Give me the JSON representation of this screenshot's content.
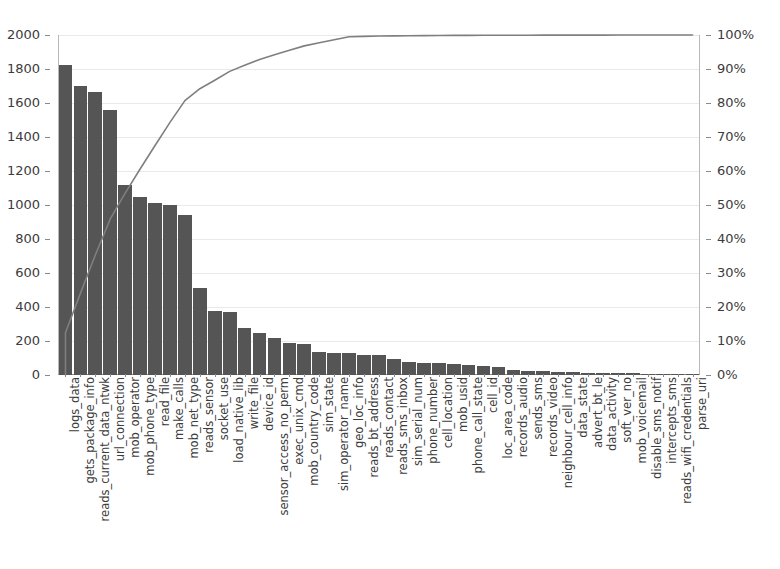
{
  "chart_data": {
    "type": "bar",
    "title": "",
    "subtitle": "",
    "xlabel": "",
    "ylabel": "",
    "y2label": "",
    "grid": true,
    "legend_position": "none",
    "ylim": [
      0,
      2000
    ],
    "y2lim": [
      0,
      100
    ],
    "y_ticks": [
      0,
      200,
      400,
      600,
      800,
      1000,
      1200,
      1400,
      1600,
      1800,
      2000
    ],
    "y_tick_labels": [
      "0",
      "200",
      "400",
      "600",
      "800",
      "1000",
      "1200",
      "1400",
      "1600",
      "1800",
      "2000"
    ],
    "y2_ticks": [
      0,
      10,
      20,
      30,
      40,
      50,
      60,
      70,
      80,
      90,
      100
    ],
    "y2_tick_labels": [
      "0%",
      "10%",
      "20%",
      "30%",
      "40%",
      "50%",
      "60%",
      "70%",
      "80%",
      "90%",
      "100%"
    ],
    "bar_color": "#555555",
    "line_color": "#7f7f7f",
    "grid_color": "#e9e9e9",
    "axis_color": "#8a8a8a",
    "categories": [
      "logs_data",
      "gets_package_info",
      "reads_current_data_ntwk",
      "url_connection",
      "mob_operator",
      "mob_phone_type",
      "read_file",
      "make_calls",
      "mob_net_type",
      "reads_sensor",
      "socket_use",
      "load_native_lib",
      "write_file",
      "device_id",
      "sensor_access_no_perm",
      "exec_unix_cmd",
      "mob_country_code",
      "sim_state",
      "sim_operator_name",
      "geo_loc_info",
      "reads_bt_address",
      "reads_contact",
      "reads_sms_inbox",
      "sim_serial_num",
      "phone_number",
      "cell_location",
      "mob_usid",
      "phone_call_state",
      "cell_id",
      "loc_area_code",
      "records_audio",
      "sends_sms",
      "records_video",
      "neighbour_cell_info",
      "data_state",
      "advert_bt_le",
      "data_activity",
      "soft_ver_no",
      "mob_voicemail",
      "disable_sms_notif",
      "intercepts_sms",
      "reads_wifi_credentials",
      "parse_uri"
    ],
    "series": [
      {
        "name": "Frequency",
        "axis": "left",
        "type": "bar",
        "values": [
          1825,
          1700,
          1665,
          1560,
          1115,
          1050,
          1010,
          1000,
          940,
          510,
          375,
          370,
          275,
          250,
          215,
          190,
          180,
          135,
          132,
          130,
          120,
          115,
          95,
          78,
          72,
          68,
          62,
          58,
          52,
          46,
          28,
          26,
          22,
          20,
          17,
          14,
          12,
          10,
          9,
          8,
          7,
          6,
          4
        ]
      },
      {
        "name": "Cumulative %",
        "axis": "right",
        "type": "line",
        "values": [
          12.4,
          24.0,
          35.3,
          45.9,
          53.5,
          60.6,
          67.5,
          74.3,
          80.7,
          84.2,
          86.7,
          89.3,
          91.1,
          92.8,
          94.2,
          95.5,
          96.8,
          97.7,
          98.6,
          99.5,
          99.6,
          99.7,
          99.75,
          99.8,
          99.83,
          99.86,
          99.88,
          99.9,
          99.91,
          99.92,
          99.93,
          99.94,
          99.95,
          99.96,
          99.965,
          99.97,
          99.975,
          99.98,
          99.985,
          99.99,
          99.993,
          99.996,
          100.0
        ]
      }
    ]
  }
}
